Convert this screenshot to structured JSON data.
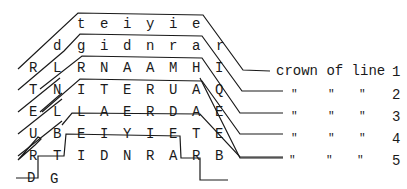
{
  "figure": {
    "type": "crown-of-line diagram",
    "rows": [
      {
        "row": 1,
        "letters": [
          "t",
          "e",
          "i",
          "y",
          "i",
          "e"
        ]
      },
      {
        "row": 2,
        "letters": [
          "d",
          "g",
          "i",
          "d",
          "n",
          "r",
          "a",
          "r"
        ]
      },
      {
        "row": 3,
        "letters": [
          "R",
          "L",
          "R",
          "N",
          "A",
          "A",
          "M",
          "H",
          "I"
        ]
      },
      {
        "row": 4,
        "letters": [
          "T",
          "N",
          "I",
          "T",
          "E",
          "R",
          "U",
          "A",
          "Q"
        ]
      },
      {
        "row": 5,
        "letters": [
          "E",
          "L",
          "L",
          "A",
          "E",
          "R",
          "D",
          "A",
          "E"
        ]
      },
      {
        "row": 6,
        "letters": [
          "U",
          "B",
          "E",
          "I",
          "Y",
          "I",
          "E",
          "T",
          "E"
        ]
      },
      {
        "row": 7,
        "letters": [
          "R",
          "T",
          "I",
          "D",
          "N",
          "R",
          "A",
          "R",
          "B"
        ]
      },
      {
        "row": 8,
        "letters": [
          "D",
          "G"
        ]
      }
    ],
    "labels": [
      {
        "line": 1,
        "text": "crown of line",
        "number": "1"
      },
      {
        "line": 2,
        "ditto": [
          "\"",
          "\"",
          "\""
        ],
        "number": "2"
      },
      {
        "line": 3,
        "ditto": [
          "\"",
          "\"",
          "\""
        ],
        "number": "3"
      },
      {
        "line": 4,
        "ditto": [
          "\"",
          "\"",
          "\""
        ],
        "number": "4"
      },
      {
        "line": 5,
        "ditto": [
          "\"",
          "\"",
          "\""
        ],
        "number": "5"
      }
    ]
  }
}
